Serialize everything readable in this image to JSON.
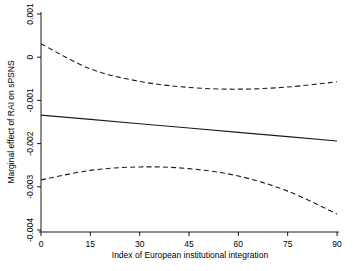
{
  "chart_data": {
    "type": "line",
    "title": "",
    "xlabel": "Index of European institutional integration",
    "ylabel": "Marginal effect of RAI on sPSNS",
    "xlim": [
      0,
      90
    ],
    "ylim": [
      -0.004,
      0.001
    ],
    "xticks": [
      "0",
      "15",
      "30",
      "45",
      "60",
      "75",
      "90"
    ],
    "xtick_values": [
      0,
      15,
      30,
      45,
      60,
      75,
      90
    ],
    "yticks": [
      "0.001",
      "0",
      "-0.001",
      "-0.002",
      "-0.003",
      "-0.004"
    ],
    "ytick_values": [
      0.001,
      0,
      -0.001,
      -0.002,
      -0.003,
      -0.004
    ],
    "grid": false,
    "legend": "none",
    "x": [
      0,
      15,
      30,
      45,
      60,
      75,
      90
    ],
    "series": [
      {
        "name": "Marginal effect",
        "style": "solid",
        "color": "#1a1a2e",
        "values": [
          -0.00134,
          -0.00144,
          -0.00154,
          -0.00164,
          -0.00174,
          -0.00184,
          -0.00194
        ]
      },
      {
        "name": "Upper 95% confidence bound",
        "style": "dashed",
        "color": "#1a1a2e",
        "values": [
          0.00031,
          -0.00027,
          -0.00056,
          -0.0007,
          -0.00074,
          -0.00069,
          -0.00057
        ]
      },
      {
        "name": "Lower 95% confidence bound",
        "style": "dashed",
        "color": "#1a1a2e",
        "values": [
          -0.00284,
          -0.00262,
          -0.00254,
          -0.00258,
          -0.00275,
          -0.0031,
          -0.00363
        ]
      }
    ]
  }
}
